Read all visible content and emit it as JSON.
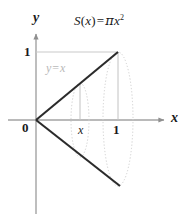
{
  "figure": {
    "type": "math-diagram",
    "background_color": "#ffffff",
    "formula": {
      "full_text": "S(x) = πx²",
      "fn_name": "S",
      "open_paren": "(",
      "arg": "x",
      "close_paren": ")",
      "equals": "=",
      "pi": "π",
      "variable": "x",
      "exponent": "2"
    },
    "axes": {
      "y_label": "y",
      "x_label": "x",
      "origin_label": "0",
      "y_tick_label": "1",
      "x_tick_labels": [
        "x",
        "1"
      ],
      "axis_color": "#9a9a9a",
      "label_color": "#1a1a1a"
    },
    "graph": {
      "line_equation_label": "y = x",
      "line_equation_parts": {
        "lhs": "y",
        "equals": "=",
        "rhs": "x"
      },
      "line_color": "#2b2b2b",
      "guide_color": "#c9c9c9",
      "ellipse_color": "#cfcfcf"
    },
    "geometry": {
      "origin": {
        "x": 36,
        "y": 120
      },
      "unit_x_px": 82,
      "unit_y_px": 68,
      "sample_x_value": 0.54,
      "apex_top": {
        "x": 118,
        "y": 52
      },
      "apex_bottom": {
        "x": 120,
        "y": 186
      }
    }
  }
}
